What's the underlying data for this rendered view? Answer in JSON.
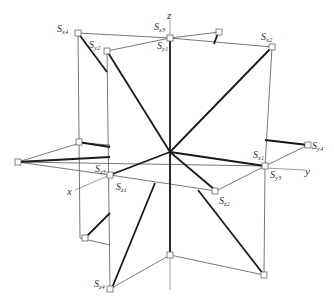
{
  "diagram": {
    "title": "",
    "axes": [
      {
        "name": "x",
        "label": "x"
      },
      {
        "name": "y",
        "label": "y"
      },
      {
        "name": "z",
        "label": "z"
      }
    ],
    "points": [
      {
        "id": "Sx4",
        "base": "S",
        "sub": "x4"
      },
      {
        "id": "Sy2",
        "base": "S",
        "sub": "y2"
      },
      {
        "id": "Sx3",
        "base": "S",
        "sub": "x3"
      },
      {
        "id": "Sy1",
        "base": "S",
        "sub": "y1"
      },
      {
        "id": "Sx2",
        "base": "S",
        "sub": "x2"
      },
      {
        "id": "Sz4",
        "base": "S",
        "sub": "z4"
      },
      {
        "id": "Sz3",
        "base": "S",
        "sub": "z3"
      },
      {
        "id": "Sz1",
        "base": "S",
        "sub": "z1"
      },
      {
        "id": "Sx1",
        "base": "S",
        "sub": "x1"
      },
      {
        "id": "Sy3",
        "base": "S",
        "sub": "y3"
      },
      {
        "id": "Sz2",
        "base": "S",
        "sub": "z2"
      },
      {
        "id": "Sy4",
        "base": "S",
        "sub": "y4"
      }
    ]
  }
}
